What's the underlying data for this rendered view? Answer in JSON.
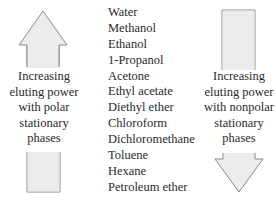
{
  "diagram": {
    "solvents": [
      "Water",
      "Methanol",
      "Ethanol",
      "1-Propanol",
      "Acetone",
      "Ethyl acetate",
      "Diethyl ether",
      "Chloroform",
      "Dichloromethane",
      "Toluene",
      "Hexane",
      "Petroleum ether"
    ],
    "left_arrow": {
      "direction": "up",
      "icon": "up-arrow-icon",
      "caption_lines": [
        "Increasing",
        "eluting power",
        "with polar",
        "stationary",
        "phases"
      ]
    },
    "right_arrow": {
      "direction": "down",
      "icon": "down-arrow-icon",
      "caption_lines": [
        "Increasing",
        "eluting power",
        "with nonpolar",
        "stationary",
        "phases"
      ]
    },
    "colors": {
      "arrow_fill": "#ececec",
      "arrow_stroke": "#8a8a8a",
      "text": "#2a2a2a"
    }
  }
}
